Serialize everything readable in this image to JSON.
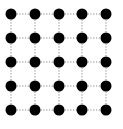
{
  "diagram": {
    "type": "grid-graph",
    "rows": 5,
    "cols": 5,
    "columns_x": [
      11,
      35,
      59,
      82,
      106
    ],
    "rows_y": [
      14,
      38,
      62,
      86,
      110
    ],
    "node_radius": 5.5,
    "node_color": "#000000",
    "edge_color": "#8a8a8a",
    "edge_style": "dotted",
    "background": "#ffffff"
  }
}
